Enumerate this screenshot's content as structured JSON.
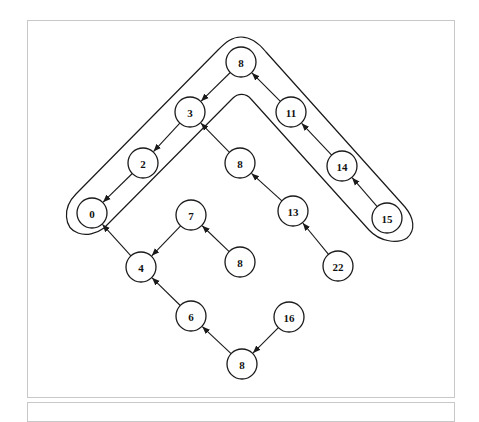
{
  "diagram": {
    "type": "tree-with-highlighted-path",
    "nodes": [
      {
        "id": "n_top8",
        "label": "8",
        "x": 241,
        "y": 62
      },
      {
        "id": "n3",
        "label": "3",
        "x": 190,
        "y": 112
      },
      {
        "id": "n11",
        "label": "11",
        "x": 291,
        "y": 112
      },
      {
        "id": "n2",
        "label": "2",
        "x": 143,
        "y": 163
      },
      {
        "id": "n_mid8",
        "label": "8",
        "x": 240,
        "y": 163
      },
      {
        "id": "n14",
        "label": "14",
        "x": 342,
        "y": 166
      },
      {
        "id": "n0",
        "label": "0",
        "x": 92,
        "y": 213
      },
      {
        "id": "n7",
        "label": "7",
        "x": 191,
        "y": 215
      },
      {
        "id": "n13",
        "label": "13",
        "x": 293,
        "y": 211
      },
      {
        "id": "n15",
        "label": "15",
        "x": 387,
        "y": 218
      },
      {
        "id": "n4",
        "label": "4",
        "x": 141,
        "y": 267
      },
      {
        "id": "n_low8",
        "label": "8",
        "x": 240,
        "y": 262
      },
      {
        "id": "n22",
        "label": "22",
        "x": 338,
        "y": 266
      },
      {
        "id": "n6",
        "label": "6",
        "x": 191,
        "y": 316
      },
      {
        "id": "n16",
        "label": "16",
        "x": 289,
        "y": 317
      },
      {
        "id": "n_bot8",
        "label": "8",
        "x": 242,
        "y": 364
      }
    ],
    "edges": [
      {
        "from": "n_top8",
        "to": "n3"
      },
      {
        "from": "n3",
        "to": "n2"
      },
      {
        "from": "n2",
        "to": "n0"
      },
      {
        "from": "n11",
        "to": "n_top8"
      },
      {
        "from": "n14",
        "to": "n11"
      },
      {
        "from": "n15",
        "to": "n14"
      },
      {
        "from": "n_mid8",
        "to": "n3"
      },
      {
        "from": "n13",
        "to": "n_mid8"
      },
      {
        "from": "n22",
        "to": "n13"
      },
      {
        "from": "n4",
        "to": "n0"
      },
      {
        "from": "n7",
        "to": "n4"
      },
      {
        "from": "n_low8",
        "to": "n7"
      },
      {
        "from": "n6",
        "to": "n4"
      },
      {
        "from": "n_bot8",
        "to": "n6"
      },
      {
        "from": "n16",
        "to": "n_bot8"
      }
    ],
    "highlighted_path": [
      "n0",
      "n2",
      "n3",
      "n_top8",
      "n11",
      "n14",
      "n15"
    ],
    "node_radius": 15
  }
}
